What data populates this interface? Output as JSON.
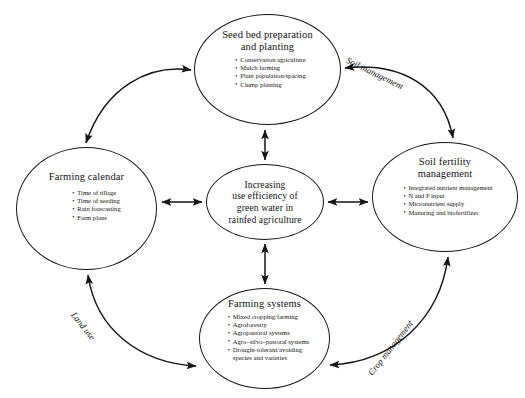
{
  "diagram": {
    "title": "Increasing use efficiency of green water in rainfed agriculture",
    "type": "cycle-diagram",
    "background_color": "#ffffff",
    "stroke_color": "#151515",
    "text_color": "#111111",
    "center": {
      "id": "center",
      "title": "Increasing\nuse efficiency of\ngreen water in\nrainfed agriculture",
      "items": []
    },
    "nodes": [
      {
        "id": "seedbed",
        "title": "Seed bed preparation\nand planting",
        "items": [
          "Conservation agriculture",
          "Mulch farming",
          "Plant population/spacing",
          "Clump planting"
        ]
      },
      {
        "id": "soil-fertility",
        "title": "Soil fertility\nmanagement",
        "items": [
          "Integrated nutrient management",
          "N and P input",
          "Micronutrient supply",
          "Manuring and biofertilizer"
        ]
      },
      {
        "id": "farming-systems",
        "title": "Farming systems",
        "items": [
          "Mixed cropping/farming",
          "Agroforestry",
          "Agropastoral systems",
          "Agro–silvo–pastoral systems",
          "Drought-tolerant/avoiding\nspecies and varieties"
        ]
      },
      {
        "id": "farming-calendar",
        "title": "Farming calendar",
        "items": [
          "Time of tillage",
          "Time of seeding",
          "Rain forecasting",
          "Farm plans"
        ]
      }
    ],
    "arc_labels": [
      {
        "id": "soil-management",
        "text": "Soil management"
      },
      {
        "id": "crop-management",
        "text": "Crop management"
      },
      {
        "id": "land-use",
        "text": "Land use"
      }
    ],
    "connections": [
      {
        "from": "center",
        "to": "seedbed",
        "style": "double-arrow-straight"
      },
      {
        "from": "center",
        "to": "soil-fertility",
        "style": "double-arrow-straight"
      },
      {
        "from": "center",
        "to": "farming-systems",
        "style": "double-arrow-straight"
      },
      {
        "from": "center",
        "to": "farming-calendar",
        "style": "double-arrow-straight"
      },
      {
        "from": "seedbed",
        "to": "farming-calendar",
        "style": "double-arrow-arc"
      },
      {
        "from": "soil-fertility",
        "to": "seedbed",
        "style": "double-arrow-arc",
        "label": "Soil management"
      },
      {
        "from": "farming-systems",
        "to": "soil-fertility",
        "style": "double-arrow-arc",
        "label": "Crop management"
      },
      {
        "from": "farming-calendar",
        "to": "farming-systems",
        "style": "double-arrow-arc",
        "label": "Land use"
      }
    ]
  }
}
